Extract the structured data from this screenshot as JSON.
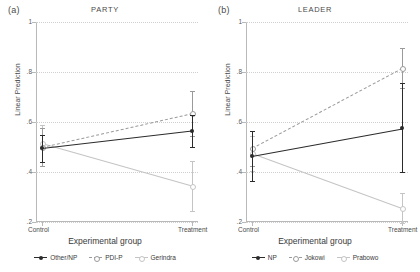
{
  "figure": {
    "axis_color": "#b9b9b9",
    "grid_color": "#cfcfcf"
  },
  "panels": [
    {
      "tag": "(a)",
      "title": "PARTY",
      "ylabel": "Linear Prediction",
      "xlabel": "Experimental group"
    },
    {
      "tag": "(b)",
      "title": "LEADER",
      "ylabel": "Linear Prediction",
      "xlabel": "Experimental group"
    }
  ],
  "chart_data": [
    {
      "type": "line",
      "title": "PARTY",
      "panel_tag": "(a)",
      "xlabel": "Experimental group",
      "ylabel": "Linear Prediction",
      "categories": [
        "Control",
        "Treatment"
      ],
      "ylim": [
        0.2,
        1.0
      ],
      "yticks": [
        0.2,
        0.4,
        0.6,
        0.8,
        1.0
      ],
      "ytick_labels": [
        ".2",
        ".4",
        ".6",
        ".8",
        "1"
      ],
      "grid": "horizontal-dotted",
      "legend_position": "bottom",
      "series": [
        {
          "name": "Other/NP",
          "color": "#2b2b2b",
          "style": "solid",
          "marker": "filled-circle",
          "values": [
            0.495,
            0.565
          ],
          "ci_low": [
            0.44,
            0.5
          ],
          "ci_high": [
            0.55,
            0.63
          ]
        },
        {
          "name": "PDI-P",
          "color": "#9a9a9a",
          "style": "dashed",
          "marker": "open-circle",
          "values": [
            0.5,
            0.635
          ],
          "ci_low": [
            0.425,
            0.545
          ],
          "ci_high": [
            0.575,
            0.725
          ]
        },
        {
          "name": "Gerindra",
          "color": "#c4c4c4",
          "style": "solid",
          "marker": "open-circle",
          "values": [
            0.515,
            0.345
          ],
          "ci_low": [
            0.44,
            0.245
          ],
          "ci_high": [
            0.59,
            0.445
          ]
        }
      ]
    },
    {
      "type": "line",
      "title": "LEADER",
      "panel_tag": "(b)",
      "xlabel": "Experimental group",
      "ylabel": "Linear Prediction",
      "categories": [
        "Control",
        "Treatment"
      ],
      "ylim": [
        0.2,
        1.0
      ],
      "yticks": [
        0.2,
        0.4,
        0.6,
        0.8,
        1.0
      ],
      "ytick_labels": [
        ".2",
        ".4",
        ".6",
        ".8",
        "1"
      ],
      "grid": "horizontal-dotted",
      "legend_position": "bottom",
      "series": [
        {
          "name": "NP",
          "color": "#2b2b2b",
          "style": "solid",
          "marker": "filled-circle",
          "values": [
            0.465,
            0.575
          ],
          "ci_low": [
            0.365,
            0.4
          ],
          "ci_high": [
            0.565,
            0.755
          ]
        },
        {
          "name": "Jokowi",
          "color": "#9a9a9a",
          "style": "dashed",
          "marker": "open-circle",
          "values": [
            0.495,
            0.815
          ],
          "ci_low": [
            0.425,
            0.735
          ],
          "ci_high": [
            0.565,
            0.895
          ]
        },
        {
          "name": "Prabowo",
          "color": "#c4c4c4",
          "style": "solid",
          "marker": "open-circle",
          "values": [
            0.475,
            0.255
          ],
          "ci_low": [
            0.405,
            0.195
          ],
          "ci_high": [
            0.545,
            0.315
          ]
        }
      ]
    }
  ]
}
